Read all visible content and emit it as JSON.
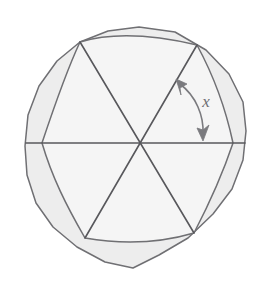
{
  "figure": {
    "angle_label": "x",
    "sector_count": 6,
    "inscribed_polygon_sides": 6,
    "outer_polygon_sides": 18
  },
  "colors": {
    "background": "#ffffff",
    "annulus_fill": "#eeeeee",
    "inner_fill": "#f4f4f4",
    "stroke": "#6f6f73",
    "line": "#58585c",
    "arrow": "#7a7a7e",
    "label": "#6e6e72"
  },
  "geometry": {
    "center": {
      "x": 139,
      "y": 143
    },
    "outer_radius": 116,
    "inner_radius": 104,
    "hexagon_circumradius": 104,
    "hexagon_rotation_deg": 20,
    "diameter_count": 3,
    "angle_arc": {
      "radius": 70,
      "start_deg": 80,
      "end_deg": 20,
      "start_point": {
        "x": 178,
        "y": 82
      },
      "end_point": {
        "x": 204,
        "y": 137
      }
    },
    "label_position": {
      "x": 206,
      "y": 102
    }
  },
  "elements": {
    "outer_boundary_name": "circle-outline",
    "inner_boundary_name": "inscribed-hexagon",
    "diameter_names": [
      "diameter-horizontal",
      "diameter-upper-left-to-lower-right",
      "diameter-upper-right-to-lower-left"
    ],
    "arrow_name": "angle-arc-arrow",
    "label_name": "angle-label-x"
  }
}
